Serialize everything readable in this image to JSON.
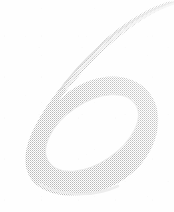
{
  "image": {
    "kind": "scanned-glyph",
    "width_px": 174,
    "height_px": 212,
    "alt_text": "Faint light-gray scanned calligraphic numeral six",
    "background_color": "#fefefe",
    "ink_color": "#c4c4c4",
    "ink_color_light": "#dcdcdc",
    "ink_color_lightest": "#efefef",
    "texture": "halftone-dither"
  },
  "glyph": {
    "character": "6",
    "style": "handwritten-script",
    "description": "A large looping numeral six with a thin tapering tail sweeping up to the top-right corner and a wide oval bowl filling the lower portion.",
    "bounding_box": {
      "x": 25,
      "y": 0,
      "width": 140,
      "height": 197
    },
    "stroke": {
      "max_width_px": 18,
      "min_width_px": 1,
      "darkest_hex": "#c4c4c4"
    },
    "counter": {
      "description": "white elliptical interior of the bowl, rotated counter-clockwise",
      "center_x": 92,
      "center_y": 133,
      "radius_x": 52,
      "radius_y": 30,
      "rotation_deg": -34
    }
  },
  "labels": {
    "figure_caption": "",
    "page_number": ""
  }
}
